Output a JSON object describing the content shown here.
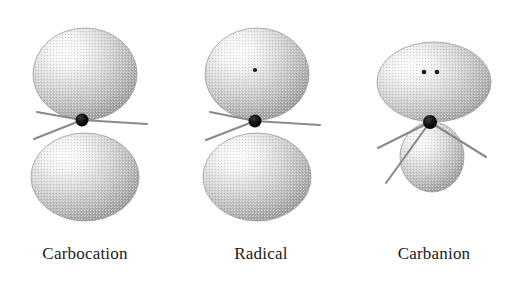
{
  "figure": {
    "background_color": "#ffffff",
    "ink_color": "#1a1a1a",
    "orbital_fill_light": "#fdfdfd",
    "orbital_fill_mid": "#c9c9c9",
    "orbital_fill_dark": "#8e8e8e",
    "bond_color": "#8a8a8a",
    "nucleus_color": "#111111",
    "electron_color": "#1a1a1a"
  },
  "species": [
    {
      "id": "carbocation",
      "label": "Carbocation",
      "label_center_x": 85,
      "label_baseline_y": 259,
      "geometry": "trigonal planar",
      "orbital": "empty p orbital",
      "electron_count": 0,
      "electrons": [],
      "lobes": [
        {
          "name": "upper-lobe",
          "cx": 85,
          "cy": 74,
          "rx": 52,
          "ry": 46
        },
        {
          "name": "lower-lobe",
          "cx": 85,
          "cy": 177,
          "rx": 54,
          "ry": 44
        }
      ],
      "nucleus": {
        "cx": 82,
        "cy": 120,
        "r": 6.5
      },
      "bonds": [
        {
          "name": "bond-upper-left",
          "x1": 82,
          "y1": 120,
          "x2": 37,
          "y2": 112
        },
        {
          "name": "bond-lower-left",
          "x1": 82,
          "y1": 120,
          "x2": 34,
          "y2": 139
        },
        {
          "name": "bond-right",
          "x1": 82,
          "y1": 120,
          "x2": 147,
          "y2": 124
        }
      ]
    },
    {
      "id": "radical",
      "label": "Radical",
      "label_center_x": 261,
      "label_baseline_y": 259,
      "geometry": "trigonal planar",
      "orbital": "singly occupied p orbital",
      "electron_count": 1,
      "electrons": [
        {
          "name": "unpaired-electron",
          "cx": 255,
          "cy": 70,
          "r": 2.1
        }
      ],
      "lobes": [
        {
          "name": "upper-lobe",
          "cx": 257,
          "cy": 74,
          "rx": 52,
          "ry": 46
        },
        {
          "name": "lower-lobe",
          "cx": 257,
          "cy": 177,
          "rx": 54,
          "ry": 44
        }
      ],
      "nucleus": {
        "cx": 255,
        "cy": 121,
        "r": 6.5
      },
      "bonds": [
        {
          "name": "bond-upper-left",
          "x1": 255,
          "y1": 121,
          "x2": 210,
          "y2": 112
        },
        {
          "name": "bond-lower-left",
          "x1": 255,
          "y1": 121,
          "x2": 206,
          "y2": 140
        },
        {
          "name": "bond-right",
          "x1": 255,
          "y1": 121,
          "x2": 320,
          "y2": 125
        }
      ]
    },
    {
      "id": "carbanion",
      "label": "Carbanion",
      "label_center_x": 434,
      "label_baseline_y": 259,
      "geometry": "pyramidal",
      "orbital": "sp3 lone pair",
      "electron_count": 2,
      "electrons": [
        {
          "name": "lone-pair-electron-left",
          "cx": 424,
          "cy": 72,
          "r": 2.3
        },
        {
          "name": "lone-pair-electron-right",
          "cx": 437,
          "cy": 72,
          "r": 2.3
        }
      ],
      "lobes": [
        {
          "name": "upper-lobe-dome",
          "cx": 434,
          "cy": 82,
          "rx": 57,
          "ry": 40
        },
        {
          "name": "lower-lobe-small",
          "cx": 432,
          "cy": 157,
          "rx": 32,
          "ry": 35
        }
      ],
      "nucleus": {
        "cx": 430,
        "cy": 122,
        "r": 7
      },
      "bonds": [
        {
          "name": "bond-left",
          "x1": 430,
          "y1": 122,
          "x2": 378,
          "y2": 148
        },
        {
          "name": "bond-lower-left",
          "x1": 430,
          "y1": 122,
          "x2": 386,
          "y2": 183
        },
        {
          "name": "bond-right",
          "x1": 430,
          "y1": 122,
          "x2": 486,
          "y2": 157
        }
      ]
    }
  ]
}
